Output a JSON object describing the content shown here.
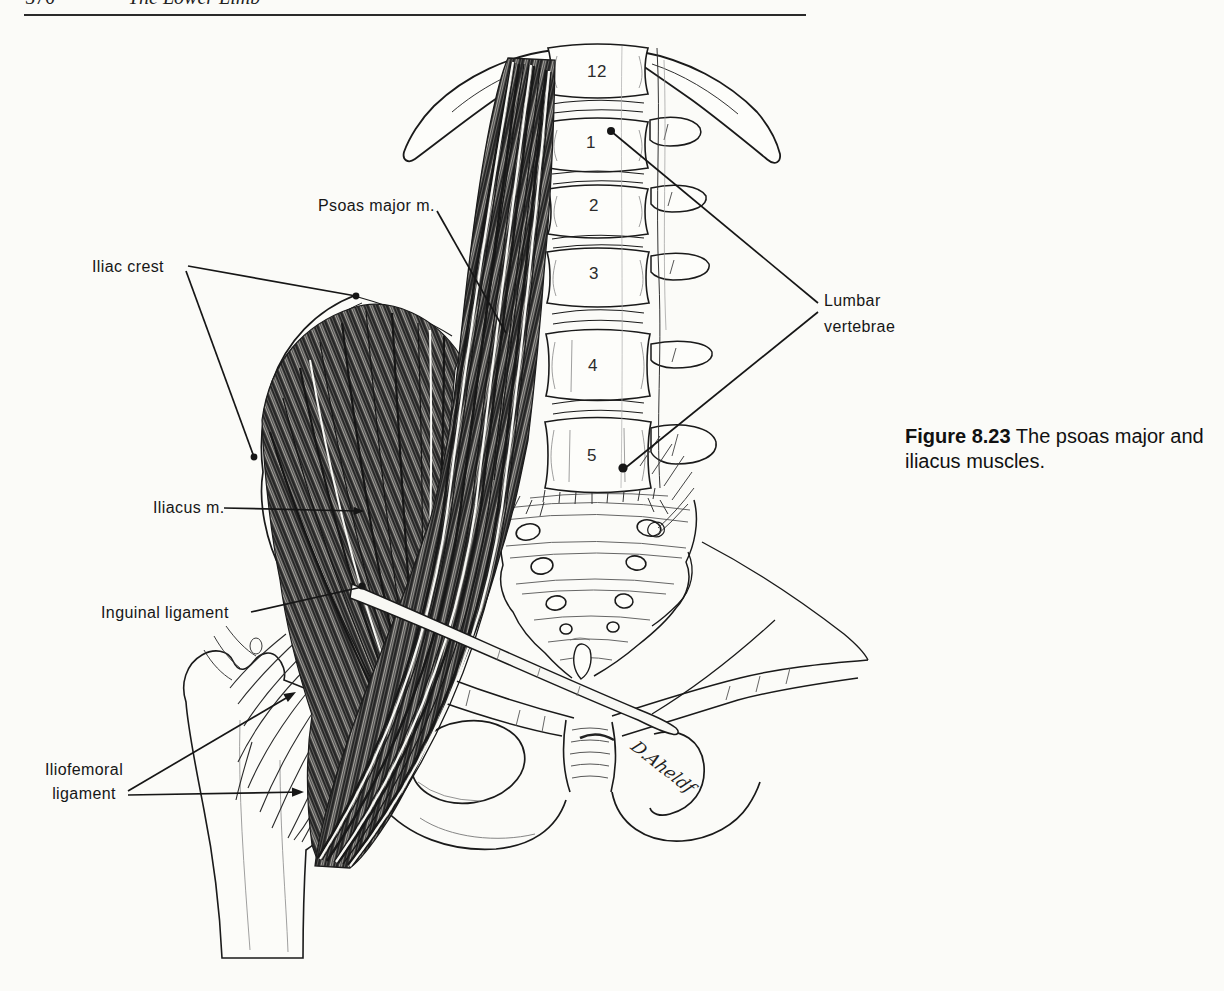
{
  "header": {
    "page_number": "370",
    "title": "The Lower Limb"
  },
  "figure": {
    "labels": {
      "psoas_major": "Psoas major m.",
      "iliac_crest": "Iliac crest",
      "iliacus": "Iliacus m.",
      "inguinal_ligament": "Inguinal ligament",
      "iliofemoral_ligament": "Iliofemoral ligament",
      "lumbar_vertebrae": "Lumbar vertebrae"
    },
    "vertebra_numbers": [
      "12",
      "1",
      "2",
      "3",
      "4",
      "5"
    ],
    "caption": {
      "label": "Figure 8.23",
      "text": "The psoas major and iliacus muscles."
    },
    "artist_signature": "D.Aheldf"
  },
  "colors": {
    "paper": "#fbfbf8",
    "ink": "#1a1a1a"
  }
}
